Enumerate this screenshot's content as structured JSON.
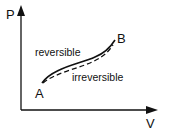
{
  "diagram": {
    "type": "PV diagram",
    "axes": {
      "y_label": "P",
      "x_label": "V"
    },
    "points": {
      "start": "A",
      "end": "B"
    },
    "curves": [
      {
        "name": "reversible",
        "style": "solid"
      },
      {
        "name": "irreversible",
        "style": "dashed"
      }
    ],
    "colors": {
      "line": "#111111",
      "background": "#ffffff"
    }
  }
}
